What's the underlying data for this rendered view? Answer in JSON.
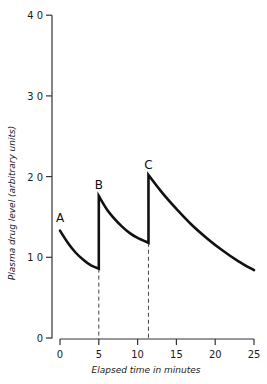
{
  "chart_data": {
    "type": "line",
    "title": "",
    "xlabel": "Elapsed time in minutes",
    "ylabel": "Plasma drug level (arbitrary units)",
    "xlim": [
      0,
      25
    ],
    "ylim": [
      0,
      40
    ],
    "x_ticks": [
      0,
      5,
      10,
      15,
      20,
      25
    ],
    "y_ticks": [
      0,
      10,
      20,
      30,
      40
    ],
    "x_tick_labels": [
      "0",
      "5",
      "10",
      "15",
      "20",
      "25"
    ],
    "y_tick_labels": [
      "0",
      "10",
      "20",
      "30",
      "40"
    ],
    "grid": false,
    "legend": null,
    "series": [
      {
        "name": "Plasma drug level",
        "segments": [
          {
            "label": "A",
            "x": [
              0,
              1,
              2,
              3,
              4,
              5
            ],
            "y": [
              13.3,
              11.8,
              10.6,
              9.7,
              9.0,
              8.6
            ]
          },
          {
            "label": "B",
            "x": [
              5,
              6,
              7,
              8,
              9,
              10,
              11.4
            ],
            "y": [
              17.6,
              16.0,
              14.8,
              13.8,
              13.0,
              12.4,
              11.8
            ]
          },
          {
            "label": "C",
            "x": [
              11.4,
              13,
              15,
              17,
              19,
              21,
              23,
              25
            ],
            "y": [
              20.2,
              18.2,
              16.0,
              14.0,
              12.3,
              10.8,
              9.5,
              8.4
            ]
          }
        ]
      }
    ],
    "annotations": [
      {
        "text": "A",
        "x": 0,
        "y": 13.3
      },
      {
        "text": "B",
        "x": 5,
        "y": 17.6
      },
      {
        "text": "C",
        "x": 11.4,
        "y": 20.2
      }
    ],
    "reference_lines": [
      {
        "type": "dashed-vertical",
        "x": 5,
        "from_y": 0,
        "to_y": 8.6
      },
      {
        "type": "dashed-vertical",
        "x": 11.4,
        "from_y": 0,
        "to_y": 11.8
      }
    ]
  },
  "axes": {
    "xlabel": "Elapsed time in minutes",
    "ylabel": "Plasma drug level (arbitrary units)"
  }
}
